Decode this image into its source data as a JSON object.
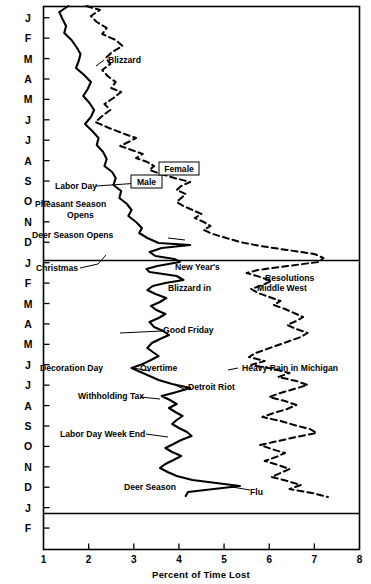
{
  "chart_data": {
    "type": "line",
    "title": "",
    "xlabel": "Percent of Time Lost",
    "ylabel": "",
    "xlim": [
      1,
      8
    ],
    "ylim_categories": [
      "J",
      "F",
      "M",
      "A",
      "M",
      "J",
      "J",
      "A",
      "S",
      "O",
      "N",
      "D",
      "J",
      "F",
      "M",
      "A",
      "M",
      "J",
      "J",
      "A",
      "S",
      "O",
      "N",
      "D",
      "J",
      "F"
    ],
    "grid": false,
    "orientation": "horizontal-value-vertical-time",
    "legend_position": "inline-boxed-labels",
    "xticks": [
      "1",
      "2",
      "3",
      "4",
      "5",
      "6",
      "7",
      "8"
    ],
    "yticks": [
      "J",
      "F",
      "M",
      "A",
      "M",
      "J",
      "J",
      "A",
      "S",
      "O",
      "N",
      "D",
      "J",
      "F",
      "M",
      "A",
      "M",
      "J",
      "J",
      "A",
      "S",
      "O",
      "N",
      "D",
      "J",
      "F"
    ],
    "series": [
      {
        "name": "Male",
        "style": "solid",
        "color": "#000000",
        "points": [
          [
            1.55,
            6
          ],
          [
            1.35,
            12
          ],
          [
            1.42,
            19
          ],
          [
            1.5,
            26
          ],
          [
            1.46,
            33
          ],
          [
            1.62,
            40
          ],
          [
            1.73,
            47
          ],
          [
            1.82,
            54
          ],
          [
            1.78,
            61
          ],
          [
            1.72,
            68
          ],
          [
            1.9,
            75
          ],
          [
            2.05,
            82
          ],
          [
            1.98,
            89
          ],
          [
            1.88,
            96
          ],
          [
            2.02,
            103
          ],
          [
            2.12,
            110
          ],
          [
            2.05,
            117
          ],
          [
            1.92,
            124
          ],
          [
            2.08,
            131
          ],
          [
            2.22,
            138
          ],
          [
            2.18,
            145
          ],
          [
            2.32,
            152
          ],
          [
            2.4,
            159
          ],
          [
            2.35,
            166
          ],
          [
            2.52,
            172
          ],
          [
            2.6,
            178
          ],
          [
            2.55,
            185
          ],
          [
            2.72,
            191
          ],
          [
            2.68,
            198
          ],
          [
            2.85,
            204
          ],
          [
            2.95,
            210
          ],
          [
            2.88,
            216
          ],
          [
            3.05,
            222
          ],
          [
            3.18,
            228
          ],
          [
            3.12,
            233
          ],
          [
            3.3,
            238
          ],
          [
            3.55,
            243
          ],
          [
            4.25,
            245
          ],
          [
            3.62,
            248
          ],
          [
            3.35,
            252
          ],
          [
            3.48,
            256
          ],
          [
            3.9,
            259
          ],
          [
            4.02,
            262
          ],
          [
            3.52,
            266
          ],
          [
            3.28,
            269
          ],
          [
            3.35,
            272
          ],
          [
            3.95,
            276
          ],
          [
            4.1,
            280
          ],
          [
            3.7,
            283
          ],
          [
            3.42,
            286
          ],
          [
            3.3,
            290
          ],
          [
            3.48,
            294
          ],
          [
            3.72,
            298
          ],
          [
            3.58,
            302
          ],
          [
            3.38,
            306
          ],
          [
            3.5,
            310
          ],
          [
            3.7,
            314
          ],
          [
            3.55,
            318
          ],
          [
            3.35,
            322
          ],
          [
            3.45,
            327
          ],
          [
            3.65,
            331
          ],
          [
            3.78,
            335
          ],
          [
            3.58,
            339
          ],
          [
            3.4,
            343
          ],
          [
            3.3,
            348
          ],
          [
            3.42,
            352
          ],
          [
            3.55,
            356
          ],
          [
            3.38,
            360
          ],
          [
            3.2,
            364
          ],
          [
            2.95,
            368
          ],
          [
            3.15,
            372
          ],
          [
            3.35,
            376
          ],
          [
            3.55,
            380
          ],
          [
            3.85,
            384
          ],
          [
            4.25,
            388
          ],
          [
            3.95,
            392
          ],
          [
            3.62,
            396
          ],
          [
            3.8,
            400
          ],
          [
            3.95,
            404
          ],
          [
            3.78,
            408
          ],
          [
            3.92,
            412
          ],
          [
            4.08,
            416
          ],
          [
            3.95,
            420
          ],
          [
            3.85,
            424
          ],
          [
            4.0,
            428
          ],
          [
            4.18,
            432
          ],
          [
            4.28,
            436
          ],
          [
            4.05,
            440
          ],
          [
            3.88,
            444
          ],
          [
            3.7,
            448
          ],
          [
            3.85,
            452
          ],
          [
            4.05,
            456
          ],
          [
            3.88,
            460
          ],
          [
            3.7,
            464
          ],
          [
            3.58,
            468
          ],
          [
            3.75,
            472
          ],
          [
            3.95,
            476
          ],
          [
            4.3,
            480
          ],
          [
            5.35,
            486
          ],
          [
            4.2,
            492
          ],
          [
            4.15,
            496
          ]
        ]
      },
      {
        "name": "Female",
        "style": "dashed",
        "color": "#000000",
        "points": [
          [
            1.95,
            6
          ],
          [
            2.25,
            10
          ],
          [
            2.05,
            16
          ],
          [
            2.18,
            22
          ],
          [
            2.4,
            28
          ],
          [
            2.3,
            34
          ],
          [
            2.6,
            40
          ],
          [
            2.75,
            46
          ],
          [
            2.52,
            52
          ],
          [
            2.38,
            58
          ],
          [
            2.48,
            64
          ],
          [
            2.3,
            70
          ],
          [
            2.42,
            76
          ],
          [
            2.6,
            82
          ],
          [
            2.5,
            88
          ],
          [
            2.72,
            92
          ],
          [
            2.55,
            98
          ],
          [
            2.35,
            104
          ],
          [
            2.48,
            110
          ],
          [
            2.3,
            116
          ],
          [
            2.15,
            122
          ],
          [
            2.45,
            128
          ],
          [
            2.8,
            134
          ],
          [
            3.05,
            138
          ],
          [
            2.88,
            142
          ],
          [
            2.7,
            146
          ],
          [
            2.95,
            150
          ],
          [
            3.2,
            154
          ],
          [
            3.05,
            158
          ],
          [
            3.3,
            162
          ],
          [
            3.45,
            166
          ],
          [
            3.35,
            170
          ],
          [
            3.6,
            174
          ],
          [
            3.9,
            178
          ],
          [
            4.25,
            182
          ],
          [
            4.05,
            186
          ],
          [
            3.95,
            190
          ],
          [
            4.15,
            194
          ],
          [
            4.05,
            198
          ],
          [
            3.95,
            202
          ],
          [
            4.1,
            206
          ],
          [
            4.3,
            210
          ],
          [
            4.5,
            214
          ],
          [
            4.35,
            218
          ],
          [
            4.55,
            222
          ],
          [
            4.7,
            226
          ],
          [
            4.55,
            230
          ],
          [
            4.75,
            234
          ],
          [
            5.05,
            238
          ],
          [
            5.35,
            242
          ],
          [
            5.8,
            246
          ],
          [
            6.4,
            250
          ],
          [
            7.0,
            254
          ],
          [
            7.2,
            258
          ],
          [
            7.1,
            262
          ],
          [
            6.4,
            266
          ],
          [
            5.75,
            270
          ],
          [
            5.5,
            273
          ],
          [
            5.8,
            277
          ],
          [
            6.05,
            281
          ],
          [
            5.85,
            285
          ],
          [
            5.6,
            289
          ],
          [
            5.75,
            293
          ],
          [
            6.0,
            297
          ],
          [
            6.25,
            301
          ],
          [
            6.1,
            305
          ],
          [
            6.35,
            309
          ],
          [
            6.55,
            313
          ],
          [
            6.75,
            317
          ],
          [
            6.6,
            321
          ],
          [
            6.4,
            325
          ],
          [
            6.6,
            329
          ],
          [
            6.85,
            333
          ],
          [
            6.7,
            337
          ],
          [
            6.45,
            341
          ],
          [
            6.2,
            345
          ],
          [
            5.95,
            349
          ],
          [
            5.7,
            353
          ],
          [
            5.55,
            357
          ],
          [
            5.9,
            361
          ],
          [
            5.6,
            365
          ],
          [
            6.1,
            369
          ],
          [
            6.45,
            373
          ],
          [
            6.2,
            377
          ],
          [
            6.6,
            381
          ],
          [
            6.85,
            385
          ],
          [
            6.55,
            389
          ],
          [
            6.25,
            393
          ],
          [
            6.0,
            397
          ],
          [
            6.35,
            401
          ],
          [
            6.6,
            405
          ],
          [
            6.4,
            409
          ],
          [
            6.1,
            413
          ],
          [
            5.85,
            417
          ],
          [
            6.25,
            421
          ],
          [
            6.55,
            425
          ],
          [
            6.9,
            429
          ],
          [
            7.05,
            433
          ],
          [
            6.6,
            437
          ],
          [
            6.2,
            441
          ],
          [
            5.8,
            445
          ],
          [
            6.05,
            449
          ],
          [
            6.35,
            453
          ],
          [
            6.15,
            457
          ],
          [
            5.9,
            461
          ],
          [
            6.2,
            465
          ],
          [
            6.45,
            469
          ],
          [
            6.25,
            473
          ],
          [
            6.05,
            477
          ],
          [
            6.4,
            481
          ],
          [
            6.7,
            485
          ],
          [
            6.45,
            489
          ],
          [
            6.95,
            493
          ],
          [
            7.3,
            497
          ]
        ]
      }
    ],
    "annotations": [
      {
        "text": "Blizzard",
        "x": 108,
        "y": 63,
        "anchor": "start"
      },
      {
        "text": "Labor Day",
        "x": 55,
        "y": 189,
        "anchor": "start"
      },
      {
        "text": "Pheasant Season",
        "x": 35,
        "y": 207,
        "anchor": "start"
      },
      {
        "text": "Opens",
        "x": 67,
        "y": 218,
        "anchor": "start"
      },
      {
        "text": "Deer Season Opens",
        "x": 32,
        "y": 238,
        "anchor": "start"
      },
      {
        "text": "Christmas",
        "x": 36,
        "y": 271,
        "anchor": "start"
      },
      {
        "text": "New Year's",
        "x": 175,
        "y": 270,
        "anchor": "start"
      },
      {
        "text": "Resolutions",
        "x": 265,
        "y": 281,
        "anchor": "start"
      },
      {
        "text": "Blizzard in",
        "x": 168,
        "y": 291,
        "anchor": "start"
      },
      {
        "text": "Middle West",
        "x": 257,
        "y": 291,
        "anchor": "start"
      },
      {
        "text": "Good Friday",
        "x": 163,
        "y": 333,
        "anchor": "start"
      },
      {
        "text": "Decoration Day",
        "x": 40,
        "y": 371,
        "anchor": "start"
      },
      {
        "text": "Overtime",
        "x": 140,
        "y": 371,
        "anchor": "start"
      },
      {
        "text": "Heavy Rain in Michigan",
        "x": 242,
        "y": 371,
        "anchor": "start"
      },
      {
        "text": "Detroit Riot",
        "x": 188,
        "y": 390,
        "anchor": "start"
      },
      {
        "text": "Withholding Tax",
        "x": 78,
        "y": 399,
        "anchor": "start"
      },
      {
        "text": "Labor Day Week End",
        "x": 60,
        "y": 437,
        "anchor": "start"
      },
      {
        "text": "Deer Season",
        "x": 124,
        "y": 490,
        "anchor": "start"
      },
      {
        "text": "Flu",
        "x": 250,
        "y": 495,
        "anchor": "start"
      }
    ],
    "boxed_labels": [
      {
        "text": "Male",
        "x": 131,
        "y": 175,
        "w": 31,
        "h": 13
      },
      {
        "text": "Female",
        "x": 159,
        "y": 162,
        "w": 40,
        "h": 13
      }
    ]
  },
  "axis": {
    "x_title": "Percent of Time Lost",
    "x_ticks": [
      "1",
      "2",
      "3",
      "4",
      "5",
      "6",
      "7",
      "8"
    ],
    "y_ticks": [
      "J",
      "F",
      "M",
      "A",
      "M",
      "J",
      "J",
      "A",
      "S",
      "O",
      "N",
      "D",
      "J",
      "F",
      "M",
      "A",
      "M",
      "J",
      "J",
      "A",
      "S",
      "O",
      "N",
      "D",
      "J",
      "F"
    ]
  }
}
